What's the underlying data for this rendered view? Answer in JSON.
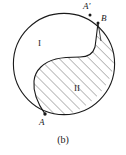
{
  "figure": {
    "caption": "(b)",
    "type": "geometric-diagram",
    "colors": {
      "stroke": "#1a1a1a",
      "hatch": "#555555",
      "background": "#ffffff"
    },
    "circle": {
      "center_x": 64,
      "center_y": 64,
      "radius": 51
    },
    "regions": [
      {
        "id": "I",
        "label": "I",
        "shaded": false,
        "label_x": 43,
        "label_y": 45
      },
      {
        "id": "II",
        "label": "II",
        "shaded": true,
        "label_x": 79,
        "label_y": 89
      }
    ],
    "points": [
      {
        "id": "A",
        "label": "A",
        "x": 45,
        "y": 114,
        "label_x": 41,
        "label_y": 123
      },
      {
        "id": "A-prime",
        "label": "A′",
        "x": 90,
        "y": 15,
        "label_x": 86,
        "label_y": 7
      },
      {
        "id": "B",
        "label": "B",
        "x": 98,
        "y": 23,
        "label_x": 104,
        "label_y": 19
      }
    ],
    "hatching": {
      "angle_degrees": 45,
      "spacing_px": 5,
      "direction": "lower-left to upper-right"
    }
  }
}
